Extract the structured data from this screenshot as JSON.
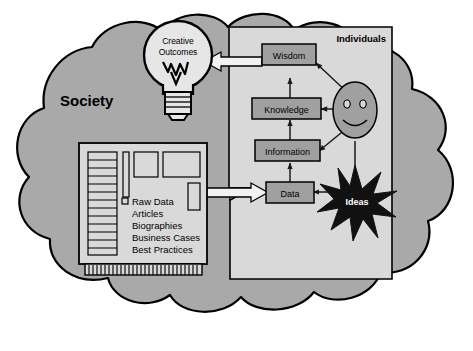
{
  "diagram": {
    "regions": {
      "society": {
        "label": "Society",
        "shape": "cloud",
        "fill": "#a9a9a9",
        "stroke": "#000000"
      },
      "individuals": {
        "label": "Individuals",
        "shape": "panel-folded-corner",
        "fill": "#d9d9d9",
        "stroke": "#000000"
      }
    },
    "bulb": {
      "line1": "Creative",
      "line2": "Outcomes",
      "icon": "lightbulb-icon",
      "fill": "#e6e6e6"
    },
    "hierarchy": {
      "boxes": [
        {
          "id": "wisdom",
          "label": "Wisdom"
        },
        {
          "id": "knowledge",
          "label": "Knowledge"
        },
        {
          "id": "information",
          "label": "Information"
        },
        {
          "id": "data",
          "label": "Data"
        }
      ],
      "box_fill": "#a0a0a0",
      "box_stroke": "#000000"
    },
    "person": {
      "icon": "smiley-face-icon",
      "fill": "#a0a0a0"
    },
    "ideas": {
      "label": "Ideas",
      "icon": "starburst-icon",
      "fill": "#111111"
    },
    "source_card": {
      "icon": "punch-card-icon",
      "fill": "#d9d9d9",
      "stroke": "#000000",
      "list": [
        "Raw Data",
        "Articles",
        "Biographies",
        "Business Cases",
        "Best Practices"
      ]
    },
    "connections": [
      {
        "from": "source_card",
        "to": "data",
        "style": "block-arrow",
        "direction": "one-way"
      },
      {
        "from": "data",
        "to": "information",
        "style": "line-arrow",
        "direction": "one-way"
      },
      {
        "from": "information",
        "to": "knowledge",
        "style": "line-arrow",
        "direction": "one-way"
      },
      {
        "from": "knowledge",
        "to": "wisdom",
        "style": "line-arrow",
        "direction": "one-way"
      },
      {
        "from": "wisdom",
        "to": "bulb",
        "style": "block-arrow",
        "direction": "one-way"
      },
      {
        "from": "wisdom",
        "to": "person",
        "style": "line-arrow",
        "direction": "two-way"
      },
      {
        "from": "knowledge",
        "to": "person",
        "style": "line-arrow",
        "direction": "two-way"
      },
      {
        "from": "information",
        "to": "person",
        "style": "line-arrow",
        "direction": "two-way"
      },
      {
        "from": "person",
        "to": "ideas",
        "style": "line-arrow",
        "direction": "one-way"
      },
      {
        "from": "ideas",
        "to": "data",
        "style": "line-arrow",
        "direction": "one-way"
      }
    ]
  }
}
